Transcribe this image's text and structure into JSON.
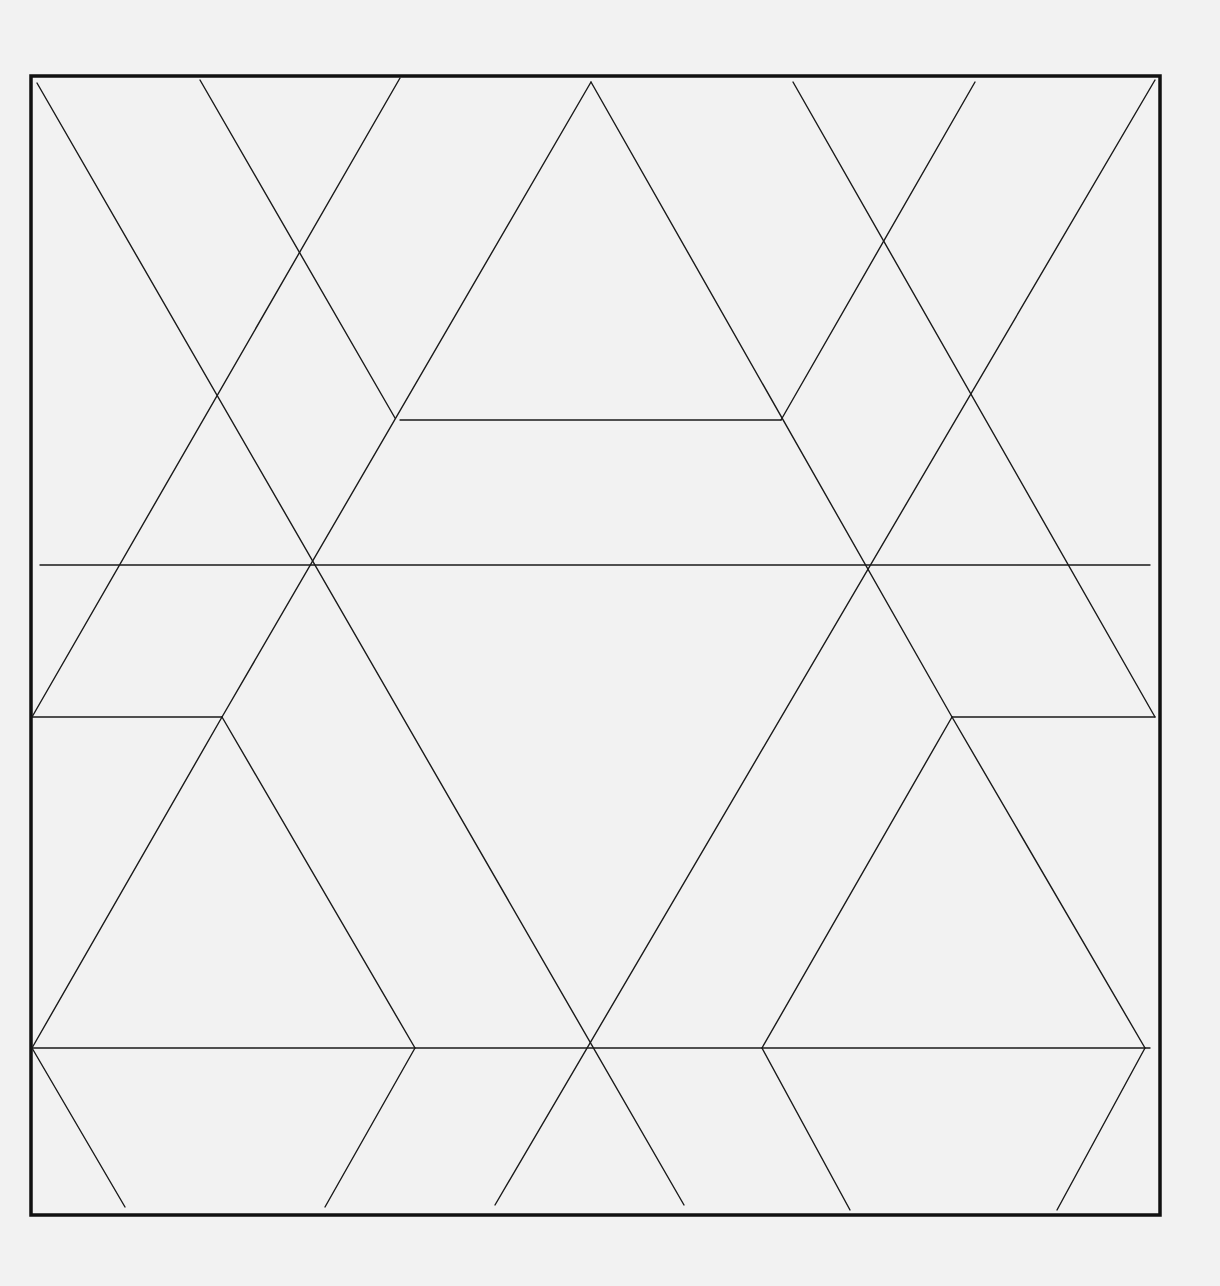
{
  "diagram": {
    "colors": {
      "background": "#f2f2f2",
      "line": "#1a1a1a",
      "frame": "#111111"
    },
    "frame": {
      "x": 31,
      "y": 76,
      "width": 1129,
      "height": 1139
    },
    "horizontal_lines": [
      {
        "name": "top-trapezoid-base",
        "x1": 400,
        "y1": 420,
        "x2": 781,
        "y2": 420
      },
      {
        "name": "middle-full-width",
        "x1": 40,
        "y1": 565,
        "x2": 1150,
        "y2": 565
      },
      {
        "name": "left-short-ledge",
        "x1": 32,
        "y1": 717,
        "x2": 222,
        "y2": 717
      },
      {
        "name": "right-short-ledge",
        "x1": 952,
        "y1": 717,
        "x2": 1155,
        "y2": 717
      },
      {
        "name": "lower-full-width",
        "x1": 32,
        "y1": 1048,
        "x2": 1150,
        "y2": 1048
      }
    ],
    "diagonal_lines": [
      {
        "name": "long-descending-left",
        "x1": 37,
        "y1": 83,
        "x2": 684,
        "y2": 1205
      },
      {
        "name": "short-descending-top-left",
        "x1": 200,
        "y1": 80,
        "x2": 395,
        "y2": 418
      },
      {
        "name": "ascending-top-left",
        "x1": 400,
        "y1": 78,
        "x2": 32,
        "y2": 717
      },
      {
        "name": "apex-left-side",
        "x1": 591,
        "y1": 82,
        "x2": 222,
        "y2": 717
      },
      {
        "name": "apex-right-side",
        "x1": 591,
        "y1": 82,
        "x2": 952,
        "y2": 717
      },
      {
        "name": "descending-top-right",
        "x1": 793,
        "y1": 82,
        "x2": 1155,
        "y2": 717
      },
      {
        "name": "short-ascending-top-right",
        "x1": 975,
        "y1": 82,
        "x2": 781,
        "y2": 420
      },
      {
        "name": "long-ascending-right",
        "x1": 1155,
        "y1": 80,
        "x2": 495,
        "y2": 1205
      },
      {
        "name": "left-triangle-left-side",
        "x1": 222,
        "y1": 717,
        "x2": 32,
        "y2": 1048
      },
      {
        "name": "left-triangle-right-side",
        "x1": 222,
        "y1": 717,
        "x2": 415,
        "y2": 1048
      },
      {
        "name": "right-triangle-left-side",
        "x1": 952,
        "y1": 717,
        "x2": 762,
        "y2": 1048
      },
      {
        "name": "right-triangle-right-side",
        "x1": 952,
        "y1": 717,
        "x2": 1145,
        "y2": 1048
      },
      {
        "name": "bottom-leg-1",
        "x1": 32,
        "y1": 1048,
        "x2": 125,
        "y2": 1207
      },
      {
        "name": "bottom-leg-2",
        "x1": 415,
        "y1": 1048,
        "x2": 325,
        "y2": 1207
      },
      {
        "name": "bottom-leg-3",
        "x1": 762,
        "y1": 1048,
        "x2": 850,
        "y2": 1210
      },
      {
        "name": "bottom-leg-4",
        "x1": 1145,
        "y1": 1048,
        "x2": 1057,
        "y2": 1210
      }
    ]
  }
}
